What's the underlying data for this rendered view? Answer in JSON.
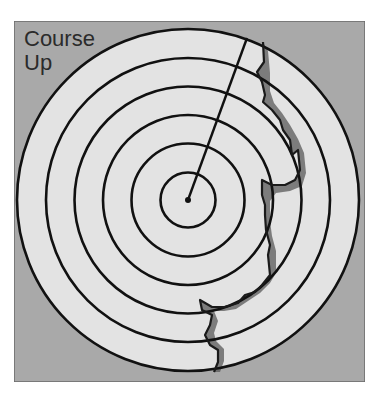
{
  "diagram": {
    "type": "radar-display",
    "mode_label_line1": "Course",
    "mode_label_line2": "Up",
    "colors": {
      "background": "#a9a9a9",
      "scope_face": "#e3e3e3",
      "rings": "#111111",
      "heading_line": "#111111",
      "coastline_outline": "#1a1a1a",
      "land_shadow": "#555555",
      "text": "#2b2b2b"
    },
    "range_rings": 6,
    "heading_line": {
      "description": "ship's head marker from center toward top-right (course up)"
    },
    "coastline": {
      "description": "land echo along the right side of the display"
    }
  }
}
